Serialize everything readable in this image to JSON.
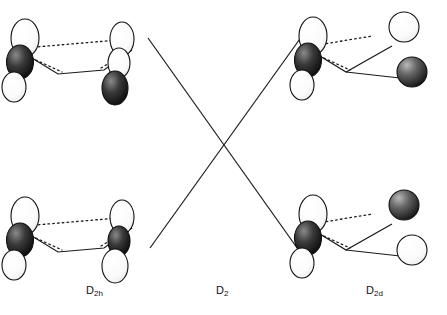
{
  "figure": {
    "type": "orbital-interaction-diagram",
    "background_color": "#ffffff",
    "line_color": "#1a1a1a",
    "lobe_fill_dark": "#151515",
    "lobe_fill_light": "#ffffff"
  },
  "labels": [
    {
      "id": "label-d2h",
      "text": "D",
      "sub": "2h",
      "x": 86,
      "y": 290
    },
    {
      "id": "label-d2",
      "text": "D",
      "sub": "2",
      "x": 216,
      "y": 290
    },
    {
      "id": "label-d2d",
      "text": "D",
      "sub": "2d",
      "x": 366,
      "y": 290
    }
  ],
  "columns": [
    {
      "name": "d2h-column",
      "label": "D2h",
      "rows": [
        "upper",
        "lower"
      ]
    },
    {
      "name": "d2-column",
      "label": "D2",
      "rows": []
    },
    {
      "name": "d2d-column",
      "label": "D2d",
      "rows": [
        "upper",
        "lower"
      ]
    }
  ],
  "correlation_lines": [
    {
      "name": "line-upper-left-to-lower-right",
      "x1": 148,
      "y1": 38,
      "x2": 300,
      "y2": 252
    },
    {
      "name": "line-lower-left-to-upper-right",
      "x1": 150,
      "y1": 248,
      "x2": 302,
      "y2": 36
    }
  ],
  "structures": [
    {
      "name": "structure-d2h-upper",
      "group": "D2h",
      "position": "upper-left",
      "orbitals": [
        "p-left-shaded",
        "p-left-outer",
        "p-right-shaded",
        "p-right-outer"
      ]
    },
    {
      "name": "structure-d2h-lower",
      "group": "D2h",
      "position": "lower-left",
      "orbitals": [
        "p-left-shaded",
        "p-left-outer",
        "p-right-shaded",
        "p-right-outer"
      ]
    },
    {
      "name": "structure-d2d-upper",
      "group": "D2d",
      "position": "upper-right",
      "orbitals": [
        "p-left-shaded",
        "p-left-outer",
        "p-right-open-circle",
        "p-right-shaded-circle"
      ]
    },
    {
      "name": "structure-d2d-lower",
      "group": "D2d",
      "position": "lower-right",
      "orbitals": [
        "p-left-shaded",
        "p-left-outer",
        "p-right-shaded-circle",
        "p-right-open-circle"
      ]
    }
  ]
}
